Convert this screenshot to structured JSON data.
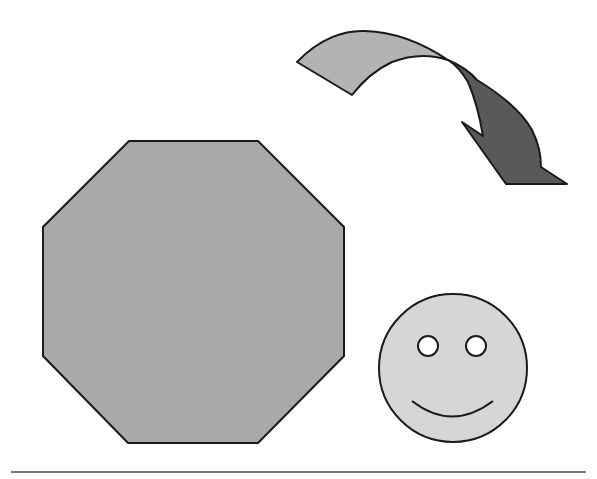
{
  "diagram": {
    "shapes": [
      {
        "id": "curved-arrow",
        "type": "curved-ribbon-arrow",
        "tail_fill": "#b3b3b3",
        "head_fill": "#595959",
        "stroke": "#1a1a1a"
      },
      {
        "id": "octagon",
        "type": "octagon",
        "fill": "#a9a9a9",
        "stroke": "#1a1a1a"
      },
      {
        "id": "smiley-face",
        "type": "smiley",
        "fill": "#d6d6d6",
        "eye_fill": "#ffffff",
        "stroke": "#1a1a1a"
      },
      {
        "id": "baseline",
        "type": "horizontal-line",
        "stroke": "#7a7a7a"
      }
    ]
  }
}
